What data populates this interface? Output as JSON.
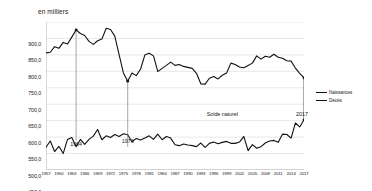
{
  "chart_data": {
    "type": "line",
    "title": "",
    "subtitle": "",
    "ylabel": "en milliers",
    "xlabel": "",
    "ylim": [
      450.0,
      900.0
    ],
    "ytick_step": 50,
    "grid": true,
    "legend_position": "right",
    "tick_labels": {
      "y": [
        "900,0",
        "850,0",
        "800,0",
        "750,0",
        "700,0",
        "650,0",
        "600,0",
        "550,0",
        "500,0",
        "450,0"
      ],
      "x": [
        "1957",
        "1960",
        "1963",
        "1966",
        "1969",
        "1972",
        "1975",
        "1978",
        "1981",
        "1984",
        "1987",
        "1990",
        "1993",
        "1996",
        "1999",
        "2002",
        "2005",
        "2008",
        "2011",
        "2014",
        "2017"
      ]
    },
    "x": [
      1957,
      1958,
      1959,
      1960,
      1961,
      1962,
      1963,
      1964,
      1965,
      1966,
      1967,
      1968,
      1969,
      1970,
      1971,
      1972,
      1973,
      1974,
      1975,
      1976,
      1977,
      1978,
      1979,
      1980,
      1981,
      1982,
      1983,
      1984,
      1985,
      1986,
      1987,
      1988,
      1989,
      1990,
      1991,
      1992,
      1993,
      1994,
      1995,
      1996,
      1997,
      1998,
      1999,
      2000,
      2001,
      2002,
      2003,
      2004,
      2005,
      2006,
      2007,
      2008,
      2009,
      2010,
      2011,
      2012,
      2013,
      2014,
      2015,
      2016,
      2017
    ],
    "series": [
      {
        "name": "Naissances",
        "color": "#111111",
        "values": [
          806,
          808,
          825,
          820,
          838,
          833,
          854,
          876,
          865,
          859,
          841,
          832,
          843,
          848,
          881,
          877,
          857,
          801,
          745,
          720,
          745,
          737,
          757,
          800,
          805,
          797,
          749,
          759,
          768,
          778,
          768,
          771,
          765,
          762,
          759,
          744,
          712,
          711,
          729,
          734,
          727,
          738,
          745,
          775,
          771,
          763,
          761,
          768,
          775,
          797,
          787,
          796,
          793,
          802,
          793,
          790,
          782,
          781,
          760,
          744,
          730
        ]
      },
      {
        "name": "Décès",
        "color": "#111111",
        "values": [
          519,
          538,
          506,
          522,
          500,
          543,
          549,
          521,
          543,
          528,
          543,
          553,
          573,
          542,
          554,
          549,
          558,
          552,
          560,
          557,
          536,
          546,
          541,
          547,
          554,
          543,
          559,
          542,
          552,
          547,
          527,
          524,
          529,
          526,
          524,
          521,
          532,
          519,
          531,
          535,
          530,
          534,
          537,
          531,
          531,
          535,
          552,
          509,
          527,
          516,
          521,
          532,
          538,
          540,
          534,
          559,
          558,
          547,
          593,
          581,
          603
        ]
      }
    ],
    "annotations": [
      {
        "name": "peak-1964",
        "label": "1964",
        "x_value": 1964,
        "marker_y": 876
      },
      {
        "name": "trough-1976",
        "label": "1976",
        "x_value": 1976,
        "marker_y": 720
      },
      {
        "name": "solde-naturel",
        "label": "Solde naturel"
      },
      {
        "name": "year-2017",
        "label": "2017",
        "x_value": 2017
      }
    ]
  },
  "legend": {
    "items": [
      {
        "label": "Naissances"
      },
      {
        "label": "Décès"
      }
    ]
  }
}
